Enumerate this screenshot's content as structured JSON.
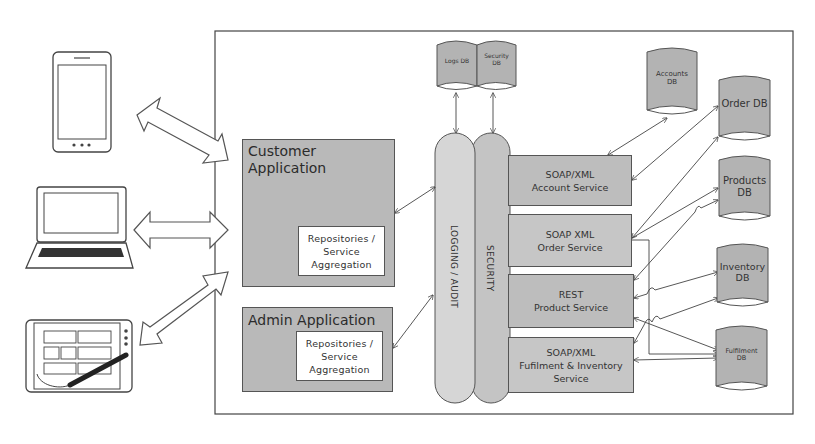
{
  "diagram": {
    "type": "system-architecture",
    "clients": [
      {
        "id": "smartphone",
        "name": "Smartphone"
      },
      {
        "id": "laptop",
        "name": "Laptop"
      },
      {
        "id": "tablet",
        "name": "Tablet with stylus"
      }
    ],
    "applications": {
      "customer": {
        "title_line1": "Customer",
        "title_line2": "Application",
        "inner": "Repositories /\nService\nAggregation"
      },
      "admin": {
        "title": "Admin Application",
        "inner": "Repositories /\nService\nAggregation"
      }
    },
    "cross_cutting": {
      "logging": "LOGGING / AUDIT",
      "security": "SECURITY"
    },
    "top_databases": {
      "logs": "Logs DB",
      "security": "Security\nDB"
    },
    "services": [
      {
        "id": "account",
        "label": "SOAP/XML\nAccount Service"
      },
      {
        "id": "order",
        "label": "SOAP XML\nOrder Service"
      },
      {
        "id": "product",
        "label": "REST\nProduct Service"
      },
      {
        "id": "fulfilment",
        "label": "SOAP/XML\nFufilment & Inventory\nService"
      }
    ],
    "databases": [
      {
        "id": "accounts",
        "label": "Accounts\nDB"
      },
      {
        "id": "order",
        "label": "Order DB"
      },
      {
        "id": "products",
        "label": "Products\nDB"
      },
      {
        "id": "inventory",
        "label": "Inventory\nDB"
      },
      {
        "id": "fulfilment",
        "label": "Fulfilment\nDB"
      }
    ],
    "colors": {
      "box_fill": "#b9b9b9",
      "pill_logging": "#d6d6d6",
      "pill_security": "#c4c4c4",
      "db_fill": "#b3b3b3",
      "stroke": "#555555"
    }
  }
}
